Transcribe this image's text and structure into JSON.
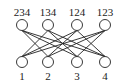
{
  "graph": {
    "type": "bipartite",
    "top_nodes": [
      {
        "label": "234",
        "x": 22,
        "y": 25
      },
      {
        "label": "134",
        "x": 48,
        "y": 25
      },
      {
        "label": "124",
        "x": 77,
        "y": 25
      },
      {
        "label": "123",
        "x": 105,
        "y": 25
      }
    ],
    "bottom_nodes": [
      {
        "label": "1",
        "x": 22,
        "y": 62
      },
      {
        "label": "2",
        "x": 48,
        "y": 62
      },
      {
        "label": "3",
        "x": 77,
        "y": 62
      },
      {
        "label": "4",
        "x": 105,
        "y": 62
      }
    ],
    "edges": [
      [
        "234",
        "2"
      ],
      [
        "234",
        "3"
      ],
      [
        "234",
        "4"
      ],
      [
        "134",
        "1"
      ],
      [
        "134",
        "3"
      ],
      [
        "134",
        "4"
      ],
      [
        "124",
        "1"
      ],
      [
        "124",
        "2"
      ],
      [
        "124",
        "4"
      ],
      [
        "123",
        "1"
      ],
      [
        "123",
        "2"
      ],
      [
        "123",
        "3"
      ]
    ],
    "colors": {
      "stroke": "#222222",
      "background": "#ffffff"
    }
  }
}
